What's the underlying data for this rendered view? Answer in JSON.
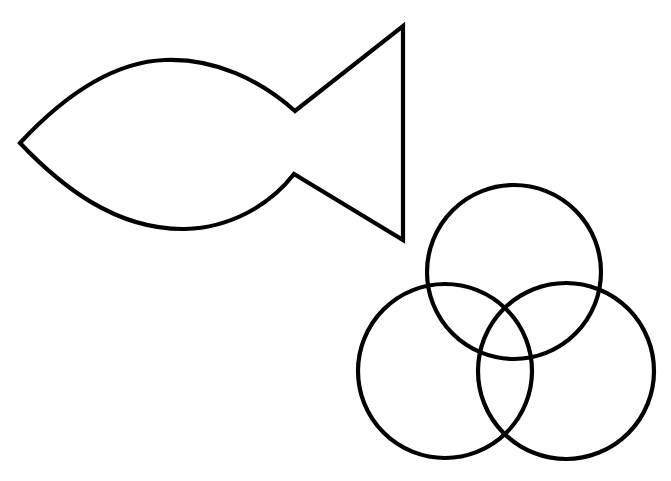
{
  "canvas": {
    "width": 671,
    "height": 481,
    "background": "#ffffff"
  },
  "style": {
    "stroke_color": "#000000",
    "stroke_width": 4.2
  },
  "shapes": {
    "fish": {
      "label": "Fish outline",
      "nose": [
        20,
        143
      ],
      "upper_tail_joint": [
        295,
        111
      ],
      "lower_tail_joint": [
        294,
        174
      ],
      "tail_top": [
        403,
        26
      ],
      "tail_bottom": [
        403,
        240
      ]
    },
    "venn": {
      "label": "Three overlapping circles",
      "circles": [
        {
          "name": "top",
          "cx": 514,
          "cy": 272,
          "r": 87
        },
        {
          "name": "bottom-left",
          "cx": 445,
          "cy": 371,
          "r": 87
        },
        {
          "name": "bottom-right",
          "cx": 566,
          "cy": 371,
          "r": 88
        }
      ]
    }
  }
}
